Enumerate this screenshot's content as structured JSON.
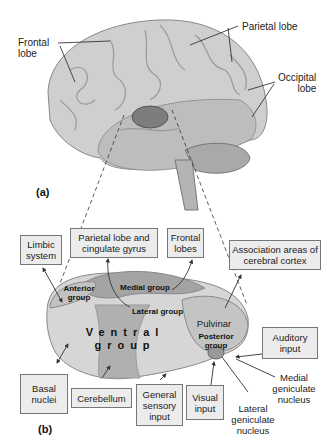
{
  "panel_a": {
    "label": "(a)",
    "callouts": [
      {
        "id": "frontal",
        "text": "Frontal\nlobe"
      },
      {
        "id": "parietal",
        "text": "Parietal lobe"
      },
      {
        "id": "occipital",
        "text": "Occipital\nlobe"
      }
    ]
  },
  "panel_b": {
    "label": "(b)",
    "regions": {
      "anterior": "Anterior group",
      "medial": "Medial group",
      "lateral": "Lateral group",
      "ventral": "Ventral group",
      "pulvinar": "Pulvinar",
      "posterior": "Posterior group"
    },
    "boxes": [
      {
        "id": "limbic",
        "text": "Limbic system"
      },
      {
        "id": "parietal_cingulate",
        "text": "Parietal lobe and cingulate gyrus"
      },
      {
        "id": "frontal_lobes",
        "text": "Frontal lobes"
      },
      {
        "id": "association",
        "text": "Association areas of cerebral cortex"
      },
      {
        "id": "auditory",
        "text": "Auditory input"
      },
      {
        "id": "basal",
        "text": "Basal nuclei"
      },
      {
        "id": "cerebellum",
        "text": "Cerebellum"
      },
      {
        "id": "general_sensory",
        "text": "General sensory input"
      },
      {
        "id": "visual",
        "text": "Visual input"
      }
    ],
    "free_labels": [
      {
        "id": "medial_geniculate",
        "text": "Medial geniculate nucleus"
      },
      {
        "id": "lateral_geniculate",
        "text": "Lateral geniculate nucleus"
      }
    ]
  }
}
